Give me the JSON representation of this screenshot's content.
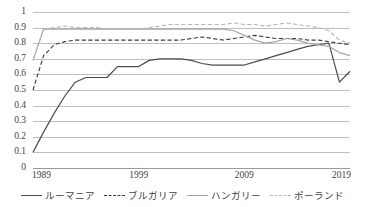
{
  "chart_data": {
    "type": "line",
    "title": "",
    "xlabel": "",
    "ylabel": "",
    "xlim": [
      1989,
      2019
    ],
    "ylim": [
      0,
      1
    ],
    "grid": true,
    "legend_position": "bottom",
    "x_tick_labels": [
      "1989",
      "1999",
      "2009",
      "2019"
    ],
    "x_ticks": [
      1989,
      1999,
      2009,
      2019
    ],
    "y_tick_labels": [
      "1",
      "0.9",
      "0.8",
      "0.7",
      "0.6",
      "0.5",
      "0.4",
      "0.3",
      "0.2",
      "0.1",
      "0"
    ],
    "y_ticks": [
      1,
      0.9,
      0.8,
      0.7,
      0.6,
      0.5,
      0.4,
      0.3,
      0.2,
      0.1,
      0
    ],
    "x": [
      1989,
      1990,
      1991,
      1992,
      1993,
      1994,
      1995,
      1996,
      1997,
      1998,
      1999,
      2000,
      2001,
      2002,
      2003,
      2004,
      2005,
      2006,
      2007,
      2008,
      2009,
      2010,
      2011,
      2012,
      2013,
      2014,
      2015,
      2016,
      2017,
      2018,
      2019
    ],
    "series": [
      {
        "name": "ルーマニア",
        "color": "#4d4d4d",
        "style": "solid",
        "values": [
          0.1,
          0.23,
          0.35,
          0.46,
          0.55,
          0.58,
          0.58,
          0.58,
          0.65,
          0.65,
          0.65,
          0.69,
          0.7,
          0.7,
          0.7,
          0.69,
          0.67,
          0.66,
          0.66,
          0.66,
          0.66,
          0.68,
          0.7,
          0.72,
          0.74,
          0.76,
          0.78,
          0.79,
          0.8,
          0.55,
          0.62
        ]
      },
      {
        "name": "ブルガリア",
        "color": "#3a3a3a",
        "style": "dashed",
        "values": [
          0.5,
          0.72,
          0.79,
          0.81,
          0.82,
          0.82,
          0.82,
          0.82,
          0.82,
          0.82,
          0.82,
          0.82,
          0.82,
          0.82,
          0.82,
          0.83,
          0.84,
          0.83,
          0.82,
          0.83,
          0.84,
          0.85,
          0.84,
          0.83,
          0.83,
          0.83,
          0.82,
          0.82,
          0.81,
          0.8,
          0.79
        ]
      },
      {
        "name": "ハンガリー",
        "color": "#a6a6a6",
        "style": "solid",
        "values": [
          0.69,
          0.89,
          0.89,
          0.89,
          0.89,
          0.89,
          0.89,
          0.89,
          0.89,
          0.89,
          0.89,
          0.89,
          0.89,
          0.89,
          0.89,
          0.89,
          0.89,
          0.89,
          0.89,
          0.88,
          0.85,
          0.82,
          0.8,
          0.81,
          0.83,
          0.82,
          0.8,
          0.79,
          0.78,
          0.74,
          0.72
        ]
      },
      {
        "name": "ポーランド",
        "color": "#b5b5b5",
        "style": "dashed",
        "values": [
          0.69,
          0.89,
          0.9,
          0.91,
          0.9,
          0.9,
          0.9,
          0.89,
          0.89,
          0.89,
          0.89,
          0.9,
          0.91,
          0.92,
          0.92,
          0.92,
          0.92,
          0.92,
          0.92,
          0.93,
          0.92,
          0.92,
          0.91,
          0.92,
          0.93,
          0.92,
          0.91,
          0.9,
          0.88,
          0.82,
          0.8
        ]
      }
    ]
  },
  "legend": {
    "items": [
      {
        "label": "ルーマニア"
      },
      {
        "label": "ブルガリア"
      },
      {
        "label": "ハンガリー"
      },
      {
        "label": "ポーランド"
      }
    ]
  }
}
